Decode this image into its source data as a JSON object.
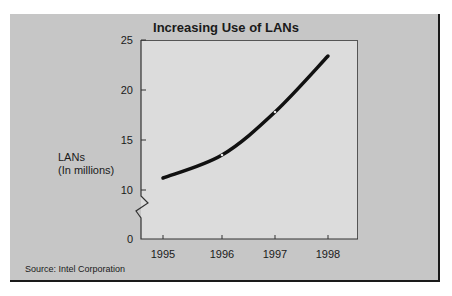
{
  "chart_data": {
    "type": "line",
    "title": "Increasing Use of LANs",
    "xlabel": "",
    "ylabel": "LANs\n(In millions)",
    "ylabel_lines": [
      "LANs",
      "(In millions)"
    ],
    "categories": [
      "1995",
      "1996",
      "1997",
      "1998"
    ],
    "x": [
      1995,
      1996,
      1997,
      1998
    ],
    "values": [
      11.2,
      13.5,
      17.8,
      23.4
    ],
    "series": [
      {
        "name": "LANs (In millions)",
        "values": [
          11.2,
          13.5,
          17.8,
          23.4
        ]
      }
    ],
    "yticks": [
      0,
      10,
      15,
      20,
      25
    ],
    "ylim": [
      0,
      25
    ],
    "axis_break": {
      "between": [
        0,
        10
      ]
    },
    "grid": false,
    "legend": "none",
    "source": "Source: Intel Corporation"
  },
  "colors": {
    "panel_bg": "#c6c6c6",
    "plot_bg": "#dcdcdc",
    "line": "#111111",
    "text": "#1a1a1a"
  }
}
